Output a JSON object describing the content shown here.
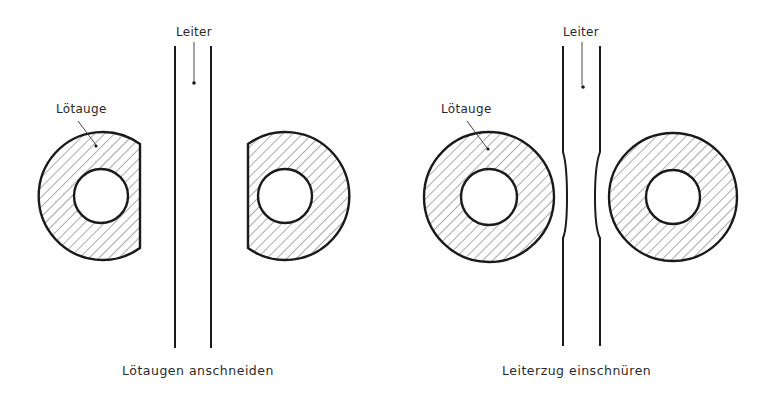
{
  "figure": {
    "left_panel": {
      "conductor_label": "Leiter",
      "pad_label": "Lötauge",
      "caption": "Lötaugen anschneiden"
    },
    "right_panel": {
      "conductor_label": "Leiter",
      "pad_label": "Lötauge",
      "caption": "Leiterzug einschnüren"
    }
  },
  "colors": {
    "ink": "#1a1a1a",
    "background": "#ffffff",
    "hatch": "#555555"
  }
}
